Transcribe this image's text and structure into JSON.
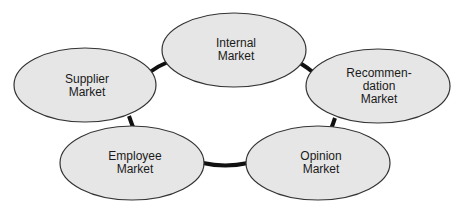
{
  "diagram": {
    "colors": {
      "node_fill": "#e6e6e6",
      "node_stroke": "#333333",
      "connector": "#111111",
      "background": "#ffffff"
    },
    "nodes": [
      {
        "id": "internal",
        "label": "Internal\nMarket"
      },
      {
        "id": "recommendation",
        "label": "Recommen-\ndation\nMarket"
      },
      {
        "id": "opinion",
        "label": "Opinion\nMarket"
      },
      {
        "id": "employee",
        "label": "Employee\nMarket"
      },
      {
        "id": "supplier",
        "label": "Supplier\nMarket"
      }
    ],
    "connections": [
      [
        "internal",
        "recommendation"
      ],
      [
        "recommendation",
        "opinion"
      ],
      [
        "opinion",
        "employee"
      ],
      [
        "employee",
        "supplier"
      ],
      [
        "supplier",
        "internal"
      ]
    ]
  }
}
